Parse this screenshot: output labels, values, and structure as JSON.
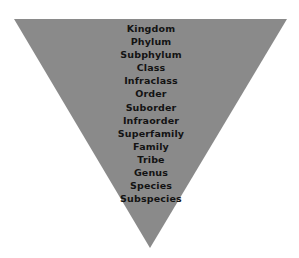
{
  "diagram": {
    "name": "taxonomic-rank-hierarchy",
    "shape": "inverted-triangle",
    "colors": {
      "background": "#ffffff",
      "triangle_fill": "#8a8a8a",
      "text": "#131313"
    },
    "geometry": {
      "top_left": [
        14,
        19
      ],
      "top_right": [
        287,
        19
      ],
      "apex": [
        150,
        248
      ]
    },
    "ranks": [
      {
        "label": "Kingdom"
      },
      {
        "label": "Phylum"
      },
      {
        "label": "Subphylum"
      },
      {
        "label": "Class"
      },
      {
        "label": "Infraclass"
      },
      {
        "label": "Order"
      },
      {
        "label": "Suborder"
      },
      {
        "label": "Infraorder"
      },
      {
        "label": "Superfamily"
      },
      {
        "label": "Family"
      },
      {
        "label": "Tribe"
      },
      {
        "label": "Genus"
      },
      {
        "label": "Species"
      },
      {
        "label": "Subspecies"
      }
    ]
  }
}
